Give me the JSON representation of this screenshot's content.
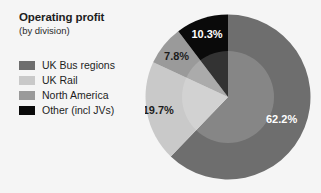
{
  "chart_data": {
    "type": "pie",
    "title": "Operating profit",
    "subtitle": "(by division)",
    "xlabel": "",
    "ylabel": "",
    "units": "percent",
    "legend_position": "left",
    "grid": false,
    "start_angle_deg": 0,
    "direction": "clockwise",
    "categories": [
      "UK Bus regions",
      "UK Rail",
      "North America",
      "Other (incl JVs)"
    ],
    "values": [
      62.2,
      19.7,
      7.8,
      10.3
    ],
    "labels": [
      "62.2%",
      "19.7%",
      "7.8%",
      "10.3%"
    ],
    "colors": [
      "#6e6e6e",
      "#c9c9c9",
      "#9a9a9a",
      "#0a0a0a"
    ],
    "label_colors": [
      "#ffffff",
      "#1d1d1d",
      "#1d1d1d",
      "#ffffff"
    ],
    "background": "#f5f5f5",
    "inner_highlight_color": "#ffffff"
  },
  "legend": {
    "items": [
      {
        "label": "UK Bus regions",
        "color": "#6e6e6e"
      },
      {
        "label": "UK Rail",
        "color": "#c9c9c9"
      },
      {
        "label": "North America",
        "color": "#9a9a9a"
      },
      {
        "label": "Other (incl JVs)",
        "color": "#0a0a0a"
      }
    ]
  }
}
